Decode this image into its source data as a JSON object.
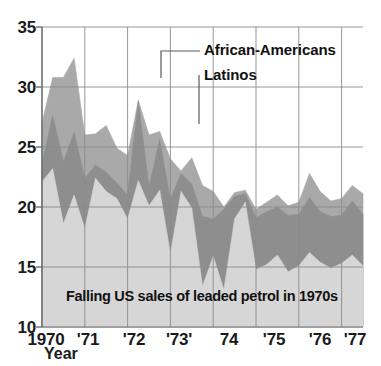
{
  "chart_data": {
    "type": "area",
    "title": "Falling US sales of leaded petrol in 1970s",
    "subtitle": "",
    "xlabel": "Year",
    "ylabel": "",
    "xlim": [
      1970,
      1977.5
    ],
    "ylim": [
      10,
      35
    ],
    "grid": true,
    "stacked": true,
    "legend_position": "in-plot-callout",
    "x_tick_labels": [
      "1970",
      "'71",
      "'72",
      "'73'",
      "74",
      "'75",
      "'76",
      "'77"
    ],
    "x_tick_values": [
      1970,
      1971,
      1972,
      1973,
      1974,
      1975,
      1976,
      1977
    ],
    "y_tick_labels": [
      "10",
      "15",
      "20",
      "25",
      "30",
      "35"
    ],
    "y_tick_values": [
      10,
      15,
      20,
      25,
      30,
      35
    ],
    "x": [
      1970.0,
      1970.25,
      1970.5,
      1970.75,
      1971.0,
      1971.25,
      1971.5,
      1971.75,
      1972.0,
      1972.25,
      1972.5,
      1972.75,
      1973.0,
      1973.25,
      1973.5,
      1973.75,
      1974.0,
      1974.25,
      1974.5,
      1974.75,
      1975.0,
      1975.25,
      1975.5,
      1975.75,
      1976.0,
      1976.25,
      1976.5,
      1976.75,
      1977.0,
      1977.25,
      1977.5
    ],
    "series": [
      {
        "name": "bottom-band",
        "label": "",
        "color": "#d6d6d6",
        "description": "lowest boundary line of the stacked bands",
        "values": [
          22.1,
          23.2,
          18.6,
          21.0,
          18.2,
          22.4,
          21.3,
          20.7,
          19.0,
          22.2,
          20.1,
          21.4,
          16.1,
          21.3,
          19.9,
          13.4,
          15.9,
          13.1,
          19.0,
          20.4,
          14.8,
          15.2,
          16.0,
          14.6,
          15.1,
          16.2,
          15.4,
          14.9,
          15.3,
          16.0,
          15.1
        ]
      },
      {
        "name": "Latinos",
        "label": "Latinos",
        "color": "#8e8e8e",
        "description": "dark middle band upper boundary",
        "values": [
          23.6,
          27.6,
          23.8,
          26.2,
          22.4,
          23.5,
          22.9,
          22.0,
          21.0,
          28.8,
          21.7,
          25.6,
          20.6,
          22.8,
          21.9,
          19.2,
          19.0,
          19.8,
          20.9,
          21.1,
          19.1,
          19.6,
          20.0,
          19.3,
          19.4,
          20.8,
          19.6,
          19.2,
          19.3,
          20.5,
          19.4
        ]
      },
      {
        "name": "African-Americans",
        "label": "African-Americans",
        "color": "#a9a9a9",
        "description": "medium grey upper band, topmost boundary",
        "values": [
          27.0,
          30.8,
          30.8,
          32.4,
          26.0,
          26.1,
          26.8,
          24.9,
          24.3,
          28.9,
          26.0,
          26.3,
          24.0,
          23.0,
          24.1,
          21.8,
          21.3,
          20.0,
          21.2,
          21.4,
          19.8,
          20.4,
          21.0,
          20.1,
          20.4,
          22.8,
          21.3,
          20.5,
          20.7,
          21.8,
          21.1
        ]
      }
    ]
  },
  "axis": {
    "y_title": "",
    "x_title": "Year"
  },
  "annotations": {
    "african_americans": "African-Americans",
    "latinos": "Latinos",
    "caption": "Falling US sales of leaded petrol in 1970s"
  },
  "colors": {
    "band_bottom": "#d6d6d6",
    "band_middle": "#8e8e8e",
    "band_top": "#a9a9a9",
    "grid": "#8b8b8b",
    "axis": "#6f6f6f",
    "text": "#111111",
    "background": "#ffffff"
  }
}
